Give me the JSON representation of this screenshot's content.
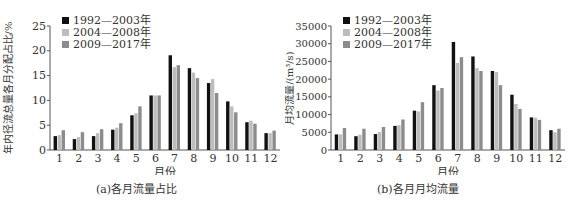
{
  "legend": {
    "series": [
      {
        "name": "1992—2003年",
        "color": "#111111"
      },
      {
        "name": "2004—2008年",
        "color": "#bdbdbd"
      },
      {
        "name": "2009—2017年",
        "color": "#8c8c8c"
      }
    ]
  },
  "chart_data": [
    {
      "type": "bar",
      "title": "(a)各月流量占比",
      "xlabel": "月份",
      "ylabel": "年内径流总量各月分配占比/%",
      "ylim": [
        0,
        25
      ],
      "yticks": [
        0,
        5,
        10,
        15,
        20,
        25
      ],
      "grid": false,
      "legend_position": "top-left",
      "categories": [
        "1",
        "2",
        "3",
        "4",
        "5",
        "6",
        "7",
        "8",
        "9",
        "10",
        "11",
        "12"
      ],
      "series": [
        {
          "name": "1992—2003年",
          "values": [
            2.8,
            2.2,
            2.8,
            4.1,
            7.0,
            11.0,
            19.1,
            16.5,
            13.5,
            9.8,
            5.6,
            3.4
          ]
        },
        {
          "name": "2004—2008年",
          "values": [
            3.0,
            2.6,
            3.4,
            4.5,
            7.4,
            11.0,
            16.7,
            15.6,
            14.3,
            8.8,
            5.9,
            3.4
          ]
        },
        {
          "name": "2009—2017年",
          "values": [
            4.0,
            3.6,
            4.2,
            5.4,
            8.8,
            11.0,
            17.1,
            14.5,
            11.5,
            7.6,
            5.3,
            3.9
          ]
        }
      ]
    },
    {
      "type": "bar",
      "title": "(b)各月月均流量",
      "xlabel": "月份",
      "ylabel": "月均流量/(m³/s)",
      "ylim": [
        0,
        35000
      ],
      "yticks": [
        0,
        5000,
        10000,
        15000,
        20000,
        25000,
        30000,
        35000
      ],
      "grid": false,
      "legend_position": "top-left",
      "categories": [
        "1",
        "2",
        "3",
        "4",
        "5",
        "6",
        "7",
        "8",
        "9",
        "10",
        "11",
        "12"
      ],
      "series": [
        {
          "name": "1992—2003年",
          "values": [
            4400,
            3900,
            4500,
            6800,
            11100,
            18300,
            30500,
            26400,
            22300,
            15600,
            9200,
            5600
          ]
        },
        {
          "name": "2004—2008年",
          "values": [
            4400,
            4300,
            5100,
            7000,
            10900,
            16800,
            24600,
            23100,
            22000,
            13000,
            9100,
            5000
          ]
        },
        {
          "name": "2009—2017年",
          "values": [
            6200,
            6000,
            6500,
            8600,
            13500,
            17500,
            26200,
            22300,
            18300,
            11600,
            8500,
            6000
          ]
        }
      ]
    }
  ]
}
